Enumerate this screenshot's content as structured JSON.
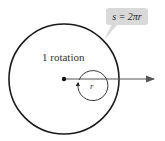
{
  "diagram": {
    "callout": {
      "formula": "s = 2πr",
      "bg": "#d9d9d9"
    },
    "rotation_label": "1 rotation",
    "radius_label": "r",
    "colors": {
      "stroke": "#1a1a1a",
      "arrow": "#555555"
    }
  }
}
